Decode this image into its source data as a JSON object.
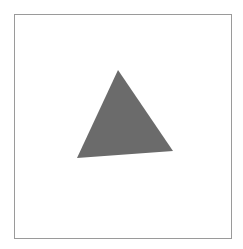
{
  "canvas": {
    "width": 243,
    "height": 249,
    "background": "#ffffff"
  },
  "frame": {
    "x": 14,
    "y": 14,
    "width": 217,
    "height": 224,
    "stroke": "#9a9a9a",
    "stroke_width": 1
  },
  "shapes": [
    {
      "type": "triangle",
      "name": "gray-triangle",
      "points": [
        [
          118,
          70
        ],
        [
          173,
          151
        ],
        [
          77,
          158
        ]
      ],
      "fill": "#6b6b6b"
    }
  ]
}
